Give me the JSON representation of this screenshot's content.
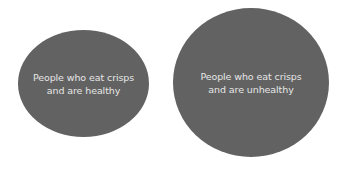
{
  "diagram": {
    "shapes": [
      {
        "label_lines": [
          "People who eat crisps",
          "and are healthy"
        ]
      },
      {
        "label_lines": [
          "People who eat crisps",
          "and are unhealthy"
        ]
      }
    ],
    "colors": {
      "fill": "#626262",
      "text": "#e6e6e6",
      "background": "#ffffff"
    }
  }
}
